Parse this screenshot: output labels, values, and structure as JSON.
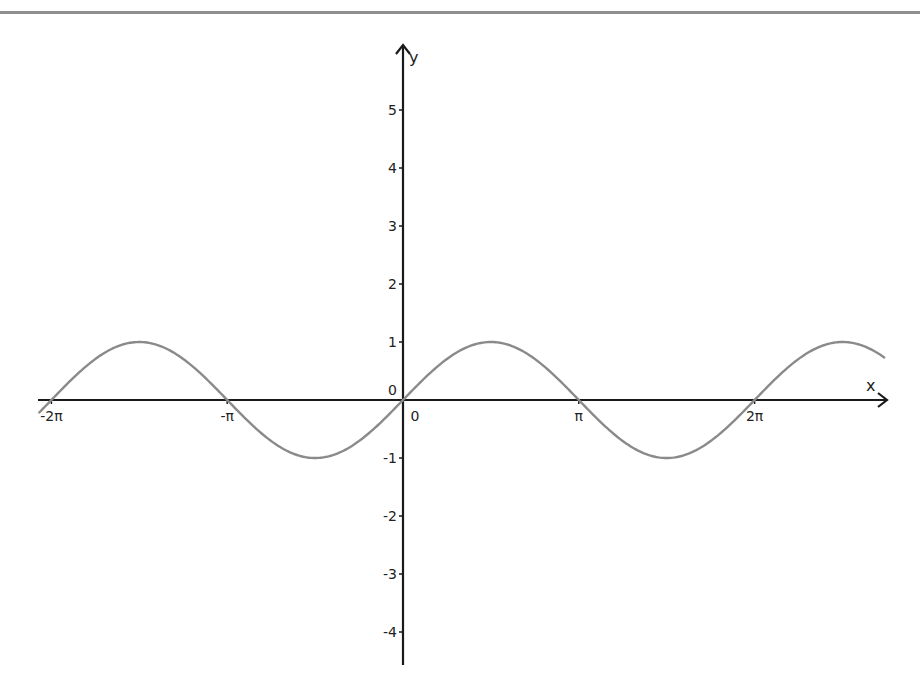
{
  "chart_data": {
    "type": "line",
    "title": "",
    "xlabel": "x",
    "ylabel": "y",
    "function": "y = sin(x)",
    "xlim": [
      -6.6,
      8.6
    ],
    "ylim": [
      -4.6,
      6.0
    ],
    "grid": false,
    "legend": null,
    "x_ticks": [
      {
        "value": -6.2832,
        "label": "-2π"
      },
      {
        "value": -3.1416,
        "label": "-π"
      },
      {
        "value": 0,
        "label": "0"
      },
      {
        "value": 3.1416,
        "label": "π"
      },
      {
        "value": 6.2832,
        "label": "2π"
      }
    ],
    "y_ticks": [
      {
        "value": 5,
        "label": "5"
      },
      {
        "value": 4,
        "label": "4"
      },
      {
        "value": 3,
        "label": "3"
      },
      {
        "value": 2,
        "label": "2"
      },
      {
        "value": 1,
        "label": "1"
      },
      {
        "value": 0,
        "label": "0"
      },
      {
        "value": -1,
        "label": "-1"
      },
      {
        "value": -2,
        "label": "-2"
      },
      {
        "value": -3,
        "label": "-3"
      },
      {
        "value": -4,
        "label": "-4"
      }
    ],
    "series": [
      {
        "name": "sin(x)",
        "color": "#8a8a8a",
        "x": [
          -6.5,
          -6.2832,
          -5.4978,
          -4.7124,
          -3.927,
          -3.1416,
          -2.3562,
          -1.5708,
          -0.7854,
          0,
          0.7854,
          1.5708,
          2.3562,
          3.1416,
          3.927,
          4.7124,
          5.4978,
          6.2832,
          7.0686,
          7.854,
          8.6
        ],
        "values": [
          -0.215,
          0,
          0.707,
          1,
          0.707,
          0,
          -0.707,
          -1,
          -0.707,
          0,
          0.707,
          1,
          0.707,
          0,
          -0.707,
          -1,
          -0.707,
          0,
          0.707,
          1,
          0.734
        ]
      }
    ]
  },
  "axes": {
    "x_label": "x",
    "y_label": "y",
    "origin_label": "0",
    "x_zero_label": "0"
  },
  "colors": {
    "axis": "#1a1a1a",
    "curve": "#8a8a8a",
    "top_rule": "#8f8f8f",
    "background": "#ffffff"
  }
}
